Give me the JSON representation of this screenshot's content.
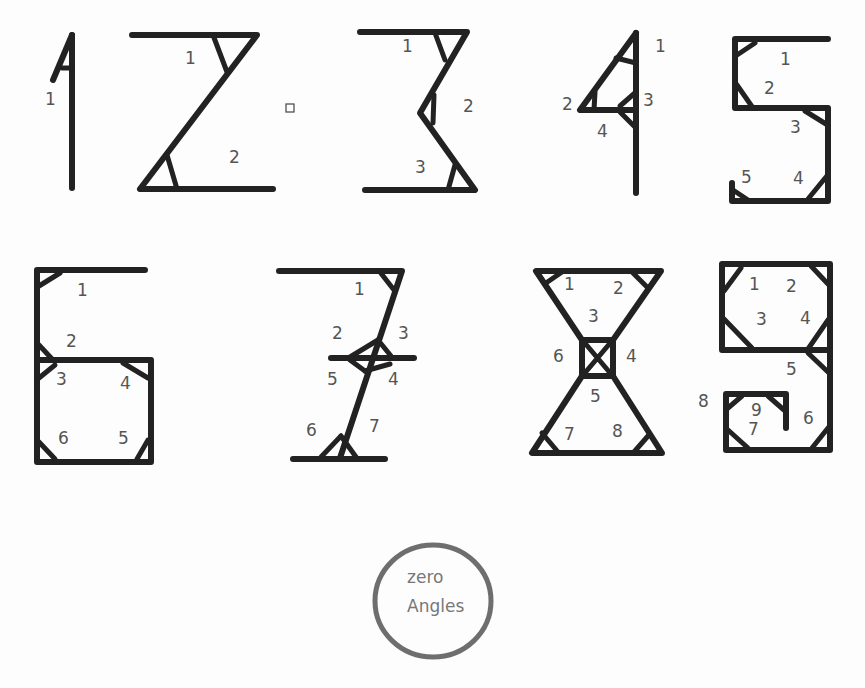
{
  "digits": [
    {
      "digit": "1",
      "angle_count": 1,
      "labels": [
        "1"
      ]
    },
    {
      "digit": "2",
      "angle_count": 2,
      "labels": [
        "1",
        "2"
      ]
    },
    {
      "digit": "3",
      "angle_count": 3,
      "labels": [
        "1",
        "2",
        "3"
      ]
    },
    {
      "digit": "4",
      "angle_count": 4,
      "labels": [
        "1",
        "2",
        "3",
        "4"
      ]
    },
    {
      "digit": "5",
      "angle_count": 5,
      "labels": [
        "1",
        "2",
        "3",
        "4",
        "5"
      ]
    },
    {
      "digit": "6",
      "angle_count": 6,
      "labels": [
        "1",
        "2",
        "3",
        "4",
        "5",
        "6"
      ]
    },
    {
      "digit": "7",
      "angle_count": 7,
      "labels": [
        "1",
        "2",
        "3",
        "4",
        "5",
        "6",
        "7"
      ]
    },
    {
      "digit": "8",
      "angle_count": 8,
      "labels": [
        "1",
        "2",
        "3",
        "4",
        "5",
        "6",
        "7",
        "8"
      ]
    },
    {
      "digit": "9",
      "angle_count": 9,
      "labels": [
        "1",
        "2",
        "3",
        "4",
        "5",
        "6",
        "7",
        "8",
        "9"
      ]
    }
  ],
  "zero": {
    "line1": "zero",
    "line2": "Angles"
  },
  "colors": {
    "stroke": "#222222",
    "label": "#555555",
    "circle": "#777777"
  }
}
